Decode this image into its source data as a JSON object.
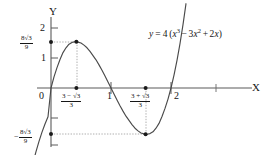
{
  "figure": {
    "axis_labels": {
      "x": "X",
      "y": "Y"
    },
    "equation": {
      "lhs": "y",
      "equals": "=",
      "coefficient": "4",
      "open_paren": "(",
      "term1_base": "x",
      "term1_exp": "3",
      "minus": "−",
      "term2_coef": "3",
      "term2_base": "x",
      "term2_exp": "2",
      "plus": "+",
      "term3_coef": "2",
      "term3_base": "x",
      "close_paren": ")",
      "full_text": "y = 4 (x³ − 3x² + 2x)"
    },
    "y_ticks": [
      {
        "label": "2",
        "value": 2
      },
      {
        "label": "1",
        "value": 1
      }
    ],
    "x_ticks": [
      {
        "label": "0",
        "value": 0
      },
      {
        "label": "1",
        "value": 1
      },
      {
        "label": "2",
        "value": 2
      }
    ],
    "fraction_labels": {
      "y_max": {
        "sign": "",
        "numerator": "8√3",
        "denominator": "9",
        "value": 1.5396
      },
      "y_min": {
        "sign": "−",
        "numerator": "8√3",
        "denominator": "9",
        "value": -1.5396
      },
      "x_max": {
        "numerator": "3 − √3",
        "denominator": "3",
        "value": 0.4226
      },
      "x_min": {
        "numerator": "3 + √3",
        "denominator": "3",
        "value": 1.5774
      }
    },
    "colors": {
      "curve": "#4a4a4a",
      "axis": "#555555",
      "guide": "#8a8a8a",
      "point": "#1a1a1a",
      "text": "#161616",
      "background": "#ffffff"
    }
  },
  "chart_data": {
    "type": "line",
    "title": "",
    "xlabel": "X",
    "ylabel": "Y",
    "xlim": [
      -0.33,
      2.6
    ],
    "ylim": [
      -2.3,
      2.4
    ],
    "grid": false,
    "legend": null,
    "function": "y = 4(x^3 - 3x^2 + 2x)",
    "x_tick_labels": [
      "0",
      "1",
      "2"
    ],
    "x_tick_values": [
      0,
      1,
      2
    ],
    "y_tick_labels": [
      "2",
      "1"
    ],
    "y_tick_values": [
      2,
      1
    ],
    "annotations": [
      {
        "text": "8√3/9",
        "x": 0,
        "y": 1.5396,
        "kind": "y-axis-label"
      },
      {
        "text": "−8√3/9",
        "x": 0,
        "y": -1.5396,
        "kind": "y-axis-label"
      },
      {
        "text": "(3−√3)/3",
        "x": 0.4226,
        "y": 0,
        "kind": "x-axis-label"
      },
      {
        "text": "(3+√3)/3",
        "x": 1.5774,
        "y": 0,
        "kind": "x-axis-label"
      },
      {
        "text": "y = 4 (x³ − 3x² + 2x)",
        "x": 1.55,
        "y": 2.0,
        "kind": "curve-label"
      }
    ],
    "marked_points": [
      {
        "x": 0.4226,
        "y": 1.5396,
        "role": "local-maximum"
      },
      {
        "x": 1.5774,
        "y": -1.5396,
        "role": "local-minimum"
      },
      {
        "x": 0,
        "y": 1.5396,
        "role": "axis-marker"
      },
      {
        "x": 0.4226,
        "y": 0,
        "role": "axis-marker"
      },
      {
        "x": 1.5774,
        "y": 0,
        "role": "axis-marker"
      },
      {
        "x": 0,
        "y": -1.5396,
        "role": "axis-marker"
      }
    ],
    "roots": [
      0,
      1,
      2
    ],
    "series": [
      {
        "name": "y = 4(x^3 - 3x^2 + 2x)",
        "x": [
          -0.3,
          -0.25,
          -0.2,
          -0.15,
          -0.1,
          -0.05,
          0.0,
          0.05,
          0.1,
          0.15,
          0.2,
          0.25,
          0.3,
          0.35,
          0.4,
          0.4226,
          0.45,
          0.5,
          0.55,
          0.6,
          0.65,
          0.7,
          0.75,
          0.8,
          0.85,
          0.9,
          0.95,
          1.0,
          1.05,
          1.1,
          1.15,
          1.2,
          1.25,
          1.3,
          1.35,
          1.4,
          1.45,
          1.5,
          1.55,
          1.5774,
          1.6,
          1.65,
          1.7,
          1.75,
          1.8,
          1.85,
          1.9,
          1.95,
          2.0,
          2.05,
          2.1,
          2.15,
          2.2,
          2.25,
          2.3
        ],
        "y": [
          -2.5,
          -2.12,
          -1.78,
          -1.47,
          -1.2,
          -0.96,
          0.0,
          0.37,
          0.68,
          0.95,
          1.18,
          1.34,
          1.46,
          1.52,
          1.54,
          1.5396,
          1.53,
          1.5,
          1.43,
          1.34,
          1.22,
          1.08,
          0.94,
          0.77,
          0.59,
          0.4,
          0.2,
          0.0,
          -0.2,
          -0.4,
          -0.59,
          -0.77,
          -0.94,
          -1.08,
          -1.22,
          -1.34,
          -1.43,
          -1.5,
          -1.53,
          -1.5396,
          -1.54,
          -1.52,
          -1.46,
          -1.34,
          -1.18,
          -0.95,
          -0.68,
          -0.37,
          0.0,
          0.43,
          0.92,
          1.48,
          2.11,
          2.81,
          3.59
        ]
      }
    ]
  }
}
